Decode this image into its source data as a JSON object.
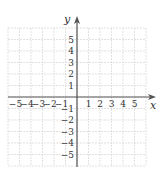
{
  "chart_data": {
    "type": "scatter",
    "title": "",
    "xlabel": "x",
    "ylabel": "y",
    "xlim": [
      -6,
      6
    ],
    "ylim": [
      -6,
      6
    ],
    "grid": true,
    "x_ticks": [
      -5,
      -4,
      -3,
      -2,
      -1,
      1,
      2,
      3,
      4,
      5
    ],
    "y_ticks": [
      5,
      4,
      3,
      2,
      1,
      -1,
      -2,
      -3,
      -4,
      -5
    ],
    "x_tick_labels": [
      "−5",
      "−4",
      "−3",
      "−2",
      "−1",
      "1",
      "2",
      "3",
      "4",
      "5"
    ],
    "y_tick_labels": [
      "5",
      "4",
      "3",
      "2",
      "1",
      "−1",
      "−2",
      "−3",
      "−4",
      "−5"
    ],
    "series": [],
    "legend": null
  },
  "colors": {
    "grid": "#d9d9d9",
    "axis": "#555555",
    "text": "#333333"
  }
}
